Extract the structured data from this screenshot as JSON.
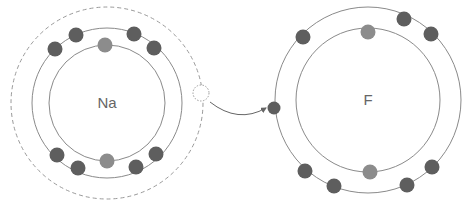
{
  "diagram": {
    "colors": {
      "shell": "#8a8a8a",
      "dashed_shell": "#9a9a9a",
      "electron_outer": "#5e5e5e",
      "electron_inner": "#8c8c8c",
      "arrow": "#666666",
      "label": "#666666"
    },
    "atoms": [
      {
        "id": "na",
        "label": "Na",
        "center": [
          107,
          103
        ],
        "shells": [
          {
            "r": 58,
            "style": "solid"
          },
          {
            "r": 75,
            "style": "solid"
          },
          {
            "r": 96,
            "style": "dashed"
          }
        ],
        "inner_electrons": [
          [
            105,
            45
          ],
          [
            107,
            161
          ]
        ],
        "outer_electrons": [
          [
            55,
            49
          ],
          [
            76,
            35
          ],
          [
            134,
            34
          ],
          [
            154,
            48
          ],
          [
            57,
            155
          ],
          [
            78,
            168
          ],
          [
            136,
            167
          ],
          [
            156,
            154
          ]
        ],
        "vacated_electron": {
          "pos": [
            201,
            93
          ],
          "r": 8
        }
      },
      {
        "id": "f",
        "label": "F",
        "center": [
          368,
          100
        ],
        "shells": [
          {
            "r": 72,
            "style": "solid"
          },
          {
            "r": 93,
            "style": "solid"
          }
        ],
        "inner_electrons": [
          [
            368,
            32
          ],
          [
            370,
            172
          ]
        ],
        "outer_electrons": [
          [
            303,
            37
          ],
          [
            404,
            19
          ],
          [
            431,
            34
          ],
          [
            305,
            171
          ],
          [
            334,
            186
          ],
          [
            407,
            185
          ],
          [
            432,
            167
          ]
        ],
        "received_electron": {
          "pos": [
            274,
            108
          ],
          "r": 6.5
        }
      }
    ],
    "arrow": {
      "path": "M 210 102 Q 238 124 266 108",
      "label": "electron transfer"
    }
  }
}
